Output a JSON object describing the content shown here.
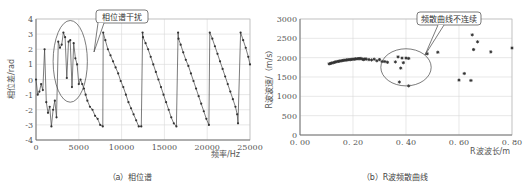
{
  "chart_data": [
    {
      "id": "a",
      "type": "line",
      "title": "",
      "caption": "（a）相位谱",
      "xlabel": "频率/Hz",
      "ylabel": "相位差/rad",
      "xlim": [
        0,
        25000
      ],
      "ylim": [
        -4,
        4
      ],
      "xticks": [
        0,
        5000,
        10000,
        15000,
        20000,
        25000
      ],
      "yticks": [
        -4,
        -3,
        -2,
        -1,
        0,
        1,
        2,
        3,
        4
      ],
      "grid": true,
      "annotation": {
        "text": "相位谱干扰",
        "ellipse_center": [
          4000,
          1.2
        ],
        "ellipse_rx": 2000,
        "ellipse_ry": 2.7
      },
      "series": [
        {
          "name": "phase",
          "x": [
            0,
            200,
            400,
            600,
            800,
            1000,
            1200,
            1400,
            1600,
            1800,
            2000,
            2200,
            2400,
            2600,
            2800,
            3000,
            3200,
            3400,
            3600,
            3800,
            4000,
            4200,
            4400,
            4600,
            4800,
            5000,
            5200,
            5400,
            5600,
            5800,
            6000,
            6300,
            6600,
            6900,
            7200,
            7500,
            7800,
            7850,
            8100,
            8400,
            8700,
            9000,
            9300,
            9600,
            9900,
            10200,
            10500,
            10800,
            11100,
            11400,
            11700,
            12000,
            12300,
            12450,
            12500,
            12800,
            13100,
            13400,
            13700,
            14000,
            14300,
            14600,
            14900,
            15200,
            15500,
            15800,
            16100,
            16400,
            16600,
            16650,
            16900,
            17200,
            17500,
            17800,
            18100,
            18400,
            18700,
            19000,
            19300,
            19600,
            19900,
            20200,
            20300,
            20600,
            20900,
            21200,
            21500,
            21800,
            22100,
            22400,
            22700,
            23000,
            23300,
            23500,
            23600,
            23900,
            24200,
            24500,
            24800,
            25000
          ],
          "y": [
            0,
            -1,
            -0.8,
            -0.3,
            -0.7,
            2.0,
            -1.5,
            -2.2,
            -1.8,
            -3.1,
            -2.0,
            -1.4,
            -2.5,
            2.5,
            2.1,
            2.3,
            3.1,
            2.8,
            0.1,
            2.5,
            2.6,
            -0.5,
            2.4,
            1.4,
            1.0,
            -0.3,
            0,
            -0.3,
            -0.6,
            -1.0,
            -1.4,
            -1.8,
            -2.0,
            -2.4,
            -2.6,
            -3.0,
            -3.1,
            3.1,
            2.6,
            2.0,
            1.6,
            1.2,
            0.8,
            0.4,
            -0.1,
            -0.5,
            -1.0,
            -1.5,
            -1.9,
            -2.3,
            -2.7,
            -3.1,
            -3.1,
            3.1,
            2.8,
            2.4,
            2.0,
            1.5,
            1.0,
            0.5,
            0,
            -0.5,
            -1.0,
            -1.5,
            -2.0,
            -2.5,
            -2.9,
            -3.1,
            3.1,
            2.7,
            2.3,
            1.8,
            1.3,
            0.9,
            0.4,
            -0.1,
            -0.6,
            -1.1,
            -1.6,
            -2.1,
            -2.6,
            -3.0,
            3.1,
            2.7,
            2.2,
            1.7,
            1.2,
            0.7,
            0.2,
            -0.3,
            -0.8,
            -1.3,
            -1.8,
            -2.3,
            -2.9,
            3.1,
            2.6,
            2.1,
            1.5,
            1.0,
            0.5
          ]
        }
      ]
    },
    {
      "id": "b",
      "type": "scatter",
      "title": "",
      "caption": "（b）R波频散曲线",
      "xlabel": "R波波长/m",
      "ylabel": "R波波速/（m/s）",
      "xlim": [
        0,
        0.8
      ],
      "ylim": [
        0,
        3000
      ],
      "xticks": [
        "0.00",
        "0.20",
        "0.40",
        "0.60",
        "0.80"
      ],
      "yticks": [
        0,
        500,
        1000,
        1500,
        2000,
        2500,
        3000
      ],
      "grid": true,
      "annotation": {
        "text": "频散曲线不连续",
        "ellipse_center": [
          0.4,
          1750
        ],
        "ellipse_rx": 0.095,
        "ellipse_ry": 480
      },
      "series": [
        {
          "name": "dispersion",
          "x": [
            0.11,
            0.115,
            0.12,
            0.125,
            0.13,
            0.135,
            0.14,
            0.145,
            0.15,
            0.155,
            0.16,
            0.165,
            0.17,
            0.175,
            0.18,
            0.185,
            0.19,
            0.195,
            0.2,
            0.205,
            0.21,
            0.215,
            0.22,
            0.225,
            0.23,
            0.235,
            0.24,
            0.245,
            0.25,
            0.26,
            0.27,
            0.28,
            0.29,
            0.3,
            0.31,
            0.32,
            0.33,
            0.36,
            0.37,
            0.375,
            0.38,
            0.385,
            0.39,
            0.4,
            0.41,
            0.41,
            0.48,
            0.52,
            0.6,
            0.62,
            0.645,
            0.65,
            0.655,
            0.67,
            0.72,
            0.8
          ],
          "y": [
            1840,
            1850,
            1860,
            1870,
            1880,
            1890,
            1900,
            1905,
            1910,
            1920,
            1925,
            1930,
            1935,
            1940,
            1945,
            1950,
            1950,
            1955,
            1960,
            1960,
            1970,
            1970,
            1975,
            1975,
            1980,
            1960,
            1950,
            1970,
            1960,
            1950,
            1940,
            1960,
            1920,
            1950,
            1900,
            1900,
            1880,
            1890,
            2020,
            1370,
            1730,
            1990,
            1870,
            1990,
            1270,
            1980,
            2100,
            2140,
            1420,
            1590,
            1410,
            2590,
            2210,
            2410,
            2150,
            2250
          ]
        }
      ]
    }
  ],
  "labels": {
    "a_caption": "（a）相位谱",
    "b_caption": "（b）R波频散曲线",
    "a_xlabel": "频率/Hz",
    "a_ylabel": "相位差/rad",
    "b_xlabel": "R波波长/m",
    "b_ylabel": "R波波速/（m/s）",
    "a_callout": "相位谱干扰",
    "b_callout": "频散曲线不连续"
  }
}
